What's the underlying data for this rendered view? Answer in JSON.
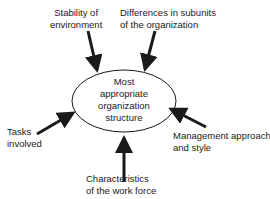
{
  "diagram": {
    "center": {
      "lines": [
        "Most",
        "appropriate",
        "organization",
        "structure"
      ]
    },
    "factors": [
      {
        "id": "stability",
        "lines": [
          "Stability of",
          "environment"
        ]
      },
      {
        "id": "subunits",
        "lines": [
          "Differences in subunits",
          "of the organization"
        ]
      },
      {
        "id": "tasks",
        "lines": [
          "Tasks",
          "involved"
        ]
      },
      {
        "id": "management",
        "lines": [
          "Management approach",
          "and style"
        ]
      },
      {
        "id": "workforce",
        "lines": [
          "Characteristics",
          "of the work force"
        ]
      }
    ]
  }
}
